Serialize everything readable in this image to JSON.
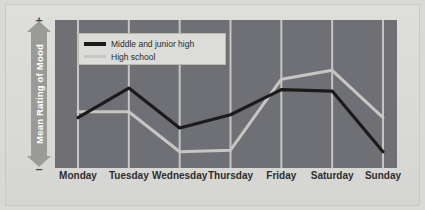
{
  "chart_data": {
    "type": "line",
    "title": "",
    "xlabel": "",
    "ylabel": "Mean Rating of Mood",
    "axis_top_symbol": "+",
    "axis_bottom_symbol": "–",
    "grid": "vertical gridlines at each category",
    "legend_position": "top-left inside plot",
    "categories": [
      "Monday",
      "Tuesday",
      "Wednesday",
      "Thursday",
      "Friday",
      "Saturday",
      "Sunday"
    ],
    "ylim": [
      0,
      100
    ],
    "series": [
      {
        "name": "Middle and junior high",
        "color": "#1b1b1b",
        "values": [
          34,
          54,
          27,
          36,
          53,
          52,
          11
        ]
      },
      {
        "name": "High school",
        "color": "#c6c6c2",
        "values": [
          38,
          38,
          11,
          12,
          60,
          66,
          34
        ]
      }
    ]
  },
  "legend": {
    "items": [
      {
        "label": "Middle and junior high",
        "color": "#1b1b1b"
      },
      {
        "label": "High school",
        "color": "#c6c6c2"
      }
    ]
  },
  "axis": {
    "y_label": "Mean Rating of Mood",
    "y_plus": "+",
    "y_minus": "–"
  },
  "colors": {
    "plot_background": "#6e7076",
    "gridline": "#d5d5d1",
    "figure_background": "#d9d9d5",
    "series_dark": "#1b1b1b",
    "series_light": "#c6c6c2"
  }
}
